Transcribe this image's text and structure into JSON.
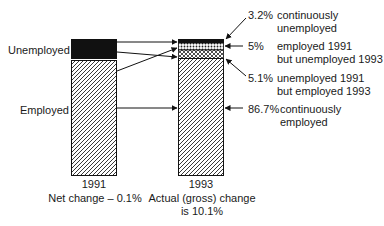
{
  "diagram": {
    "left_labels": {
      "unemployed": "Unemployed",
      "employed": "Employed"
    },
    "bars": [
      {
        "year": "1991",
        "caption": "Net change – 0.1%",
        "segments": [
          {
            "name": "unemployed",
            "fill": "solid-black"
          },
          {
            "name": "employed",
            "fill": "diagonal-hatch"
          }
        ]
      },
      {
        "year": "1993",
        "caption_line1": "Actual (gross) change",
        "caption_line2": "is 10.1%",
        "segments": [
          {
            "name": "continuously-unemployed",
            "fill": "solid-black"
          },
          {
            "name": "employed-1991-unemployed-1993",
            "fill": "dotted"
          },
          {
            "name": "unemployed-1991-employed-1993",
            "fill": "cross-hatch"
          },
          {
            "name": "continuously-employed",
            "fill": "diagonal-hatch"
          }
        ]
      }
    ],
    "annotations": [
      {
        "pct": "3.2%",
        "line1": "continuously",
        "line2": "unemployed"
      },
      {
        "pct": "5%",
        "line1": "employed 1991",
        "line2": "but unemployed 1993"
      },
      {
        "pct": "5.1%",
        "line1": "unemployed 1991",
        "line2": "but employed 1993"
      },
      {
        "pct": "86.7%",
        "line1": "continuously",
        "line2": "employed"
      }
    ],
    "colors": {
      "ink": "#111111",
      "background": "#ffffff"
    }
  }
}
